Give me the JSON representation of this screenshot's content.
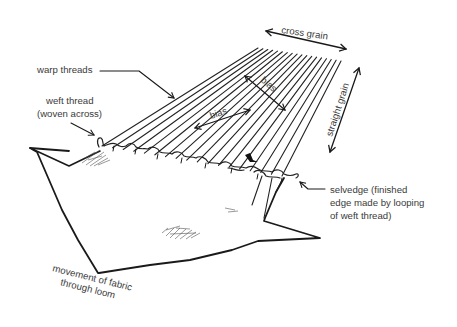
{
  "diagram": {
    "labels": {
      "cross_grain": "cross grain",
      "straight_grain": "straight grain",
      "warp_threads": "warp threads",
      "weft_line1": "weft thread",
      "weft_line2": "(woven across)",
      "bias_upper": "bias",
      "bias_lower": "bias",
      "selvedge_line1": "selvedge (finished",
      "selvedge_line2": "edge made by looping",
      "selvedge_line3": "of weft thread)",
      "movement_line1": "movement of fabric",
      "movement_line2": "through loom"
    },
    "colors": {
      "ink": "#1a1a1a",
      "label_text": "#3a3a3a",
      "background": "#ffffff"
    },
    "warp_thread_count": 18
  }
}
